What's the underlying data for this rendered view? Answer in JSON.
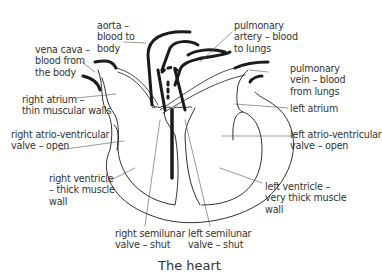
{
  "diagram": {
    "title": "The heart",
    "labels": {
      "aorta": "aorta –\nblood to\nbody",
      "vena_cava": "vena cava –\nblood from\nthe body",
      "pulmonary_artery": "pulmonary\nartery – blood\nto lungs",
      "pulmonary_vein": "pulmonary\nvein – blood\nfrom lungs",
      "right_atrium": "right atrium –\nthin muscular walls",
      "left_atrium": "left atrium",
      "right_av_valve": "right atrio-ventricular\nvalve – open",
      "left_av_valve": "left atrio-ventricular\nvalve – open",
      "right_ventricle": "right ventricle\n– thick muscle\nwall",
      "left_ventricle": "left ventricle –\nvery thick muscle\nwall",
      "right_semilunar": "right semilunar\nvalve – shut",
      "left_semilunar": "left semilunar\nvalve – shut"
    },
    "colors": {
      "line": "#1a1a1a",
      "text": "#333333",
      "background": "#ffffff"
    }
  }
}
